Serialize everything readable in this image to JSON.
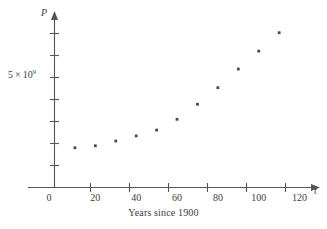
{
  "chart_data": {
    "type": "scatter",
    "title": "",
    "subtitle": "",
    "xlabel": "Years since 1900",
    "ylabel": "P",
    "x_axis_variable": "t",
    "y_axis_variable": "P",
    "x": [
      10,
      20,
      30,
      40,
      50,
      60,
      70,
      80,
      90,
      100,
      110
    ],
    "values": [
      1770000000,
      1860000000,
      2070000000,
      2300000000,
      2560000000,
      3040000000,
      3710000000,
      4450000000,
      5280000000,
      6080000000,
      6900000000
    ],
    "series": [
      {
        "name": "Population",
        "values": [
          1770000000,
          1860000000,
          2070000000,
          2300000000,
          2560000000,
          3040000000,
          3710000000,
          4450000000,
          5280000000,
          6080000000,
          6900000000
        ]
      }
    ],
    "xlim": [
      0,
      130
    ],
    "ylim": [
      0,
      7600000000
    ],
    "x_ticks": [
      0,
      20,
      40,
      60,
      80,
      100,
      120
    ],
    "x_tick_labels": [
      "0",
      "20",
      "40",
      "60",
      "80",
      "100",
      "120"
    ],
    "y_ticks": [
      1000000000,
      2000000000,
      3000000000,
      4000000000,
      5000000000,
      6000000000,
      7000000000
    ],
    "y_tick_labels": [
      "",
      "",
      "",
      "",
      "5 × 10⁹",
      "",
      ""
    ],
    "y_labeled_tick": {
      "value": 5000000000,
      "mantissa": "5",
      "times": "×",
      "base": "10",
      "exponent": "9"
    },
    "grid": false,
    "legend": false,
    "legend_position": "none",
    "marker": "square",
    "marker_color": "#4a4a52",
    "axis_color": "#545454",
    "background_color": "#ffffff",
    "x_axis_has_arrow": true,
    "y_axis_has_arrow": true,
    "annotations": []
  },
  "figure": {
    "caption": "Years since 1900",
    "origin_label": "0"
  }
}
